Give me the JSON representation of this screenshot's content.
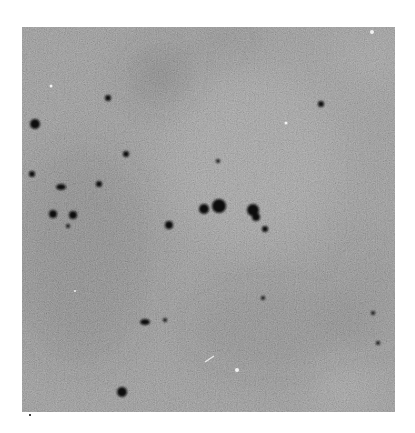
{
  "image": {
    "kind": "grayscale photographic plate / star field",
    "frame": {
      "x": 22,
      "y": 27,
      "width": 373,
      "height": 385
    },
    "background_color": "#8e8e8e",
    "dark_regions": [
      {
        "cx": 138,
        "cy": 48,
        "rx": 30,
        "ry": 28,
        "opacity": 0.35
      },
      {
        "cx": 203,
        "cy": 12,
        "rx": 30,
        "ry": 14,
        "opacity": 0.25
      },
      {
        "cx": 60,
        "cy": 230,
        "rx": 70,
        "ry": 110,
        "opacity": 0.22
      },
      {
        "cx": 250,
        "cy": 300,
        "rx": 90,
        "ry": 50,
        "opacity": 0.15
      },
      {
        "cx": 350,
        "cy": 270,
        "rx": 40,
        "ry": 60,
        "opacity": 0.12
      }
    ],
    "light_regions": [
      {
        "cx": 230,
        "cy": 130,
        "rx": 90,
        "ry": 90,
        "opacity": 0.18
      },
      {
        "cx": 320,
        "cy": 360,
        "rx": 30,
        "ry": 30,
        "opacity": 0.2
      },
      {
        "cx": 350,
        "cy": 30,
        "rx": 40,
        "ry": 30,
        "opacity": 0.15
      }
    ],
    "dark_spots": [
      {
        "cx": 13,
        "cy": 97,
        "r": 5
      },
      {
        "cx": 86,
        "cy": 71,
        "r": 3
      },
      {
        "cx": 104,
        "cy": 127,
        "r": 3
      },
      {
        "cx": 10,
        "cy": 147,
        "r": 3
      },
      {
        "cx": 39,
        "cy": 160,
        "r": 4,
        "rx": 5,
        "ry": 3
      },
      {
        "cx": 77,
        "cy": 157,
        "r": 3
      },
      {
        "cx": 31,
        "cy": 187,
        "r": 4
      },
      {
        "cx": 51,
        "cy": 188,
        "r": 4
      },
      {
        "cx": 46,
        "cy": 199,
        "r": 2
      },
      {
        "cx": 182,
        "cy": 182,
        "r": 5
      },
      {
        "cx": 197,
        "cy": 179,
        "r": 7
      },
      {
        "cx": 231,
        "cy": 183,
        "r": 6
      },
      {
        "cx": 234,
        "cy": 190,
        "r": 4
      },
      {
        "cx": 243,
        "cy": 202,
        "r": 3
      },
      {
        "cx": 196,
        "cy": 134,
        "r": 2
      },
      {
        "cx": 299,
        "cy": 77,
        "r": 3
      },
      {
        "cx": 123,
        "cy": 295,
        "r": 4,
        "rx": 5,
        "ry": 3
      },
      {
        "cx": 143,
        "cy": 293,
        "r": 2
      },
      {
        "cx": 241,
        "cy": 271,
        "r": 2
      },
      {
        "cx": 351,
        "cy": 286,
        "r": 2
      },
      {
        "cx": 356,
        "cy": 316,
        "r": 2
      },
      {
        "cx": 100,
        "cy": 365,
        "r": 5
      },
      {
        "cx": 147,
        "cy": 198,
        "r": 4
      }
    ],
    "white_specks": [
      {
        "cx": 29,
        "cy": 59,
        "r": 1.5
      },
      {
        "cx": 264,
        "cy": 96,
        "r": 1.5
      },
      {
        "cx": 215,
        "cy": 343,
        "r": 2
      },
      {
        "cx": 53,
        "cy": 264,
        "r": 1
      },
      {
        "cx": 350,
        "cy": 5,
        "r": 2
      }
    ],
    "white_streak": {
      "x1": 183,
      "y1": 335,
      "x2": 192,
      "y2": 329
    }
  },
  "marker_dot": {
    "x": 29,
    "y": 414
  }
}
